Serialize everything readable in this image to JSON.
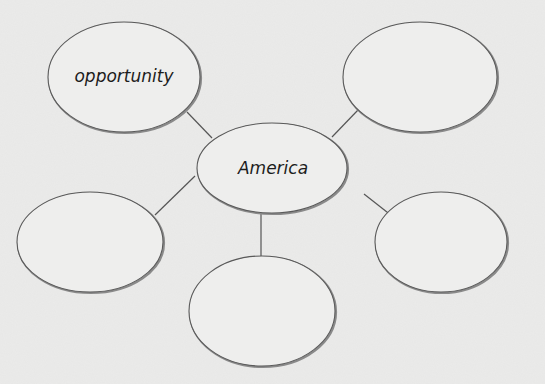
{
  "diagram": {
    "type": "web organizer",
    "center": {
      "label": "America"
    },
    "branches": [
      {
        "position": "top-left",
        "label": "opportunity"
      },
      {
        "position": "top-right",
        "label": ""
      },
      {
        "position": "bottom-left",
        "label": ""
      },
      {
        "position": "bottom-right",
        "label": ""
      },
      {
        "position": "bottom-center",
        "label": ""
      }
    ]
  },
  "colors": {
    "background": "#ebebea",
    "ellipse_fill": "#eeeeed",
    "stroke": "#555555",
    "text": "#1c1c1c"
  }
}
